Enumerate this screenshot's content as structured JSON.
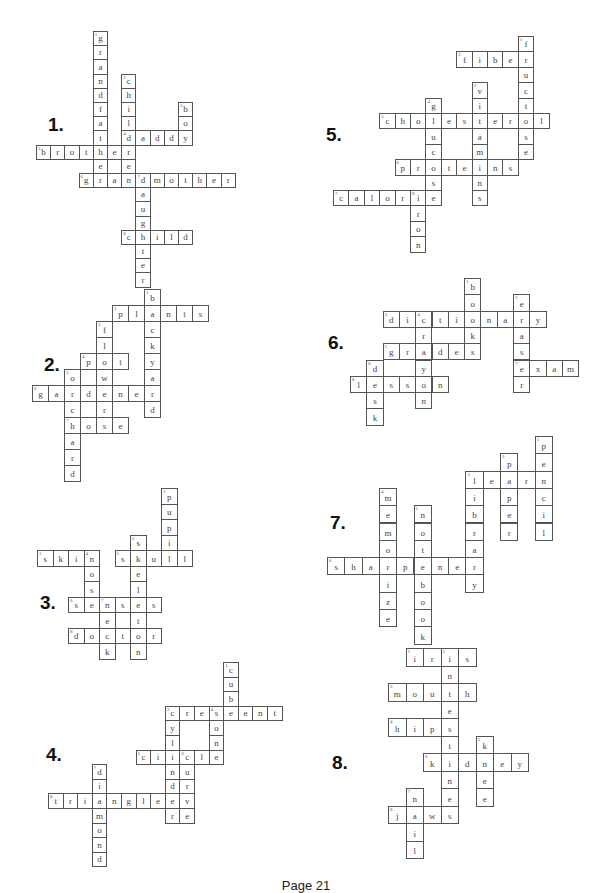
{
  "page": {
    "footer": "Page 21"
  },
  "puzzles": [
    {
      "number": "1.",
      "label_pos": [
        48,
        114
      ],
      "origin": [
        36,
        31
      ],
      "cell": 14.2,
      "words": [
        {
          "n": "1",
          "word": "grandfather",
          "dir": "down",
          "r": 0,
          "c": 4
        },
        {
          "n": "2",
          "word": "children",
          "dir": "down",
          "r": 3,
          "c": 6
        },
        {
          "n": "3",
          "word": "boy",
          "dir": "down",
          "r": 5,
          "c": 10
        },
        {
          "n": "4",
          "word": "daddy",
          "dir": "across",
          "r": 7,
          "c": 6
        },
        {
          "n": "5",
          "word": "brother",
          "dir": "across",
          "r": 8,
          "c": 0
        },
        {
          "n": "6",
          "word": "grandmother",
          "dir": "across",
          "r": 10,
          "c": 3
        },
        {
          "n": "7",
          "word": "daughter",
          "dir": "down",
          "r": 10,
          "c": 7
        },
        {
          "n": "8",
          "word": "child",
          "dir": "across",
          "r": 14,
          "c": 6
        }
      ]
    },
    {
      "number": "2.",
      "label_pos": [
        44,
        354
      ],
      "origin": [
        32,
        289
      ],
      "cell": 16,
      "words": [
        {
          "n": "1",
          "word": "backyard",
          "dir": "down",
          "r": 0,
          "c": 7
        },
        {
          "n": "2",
          "word": "plants",
          "dir": "across",
          "r": 1,
          "c": 5
        },
        {
          "n": "3",
          "word": "flower",
          "dir": "down",
          "r": 2,
          "c": 4
        },
        {
          "n": "4",
          "word": "pot",
          "dir": "across",
          "r": 4,
          "c": 3
        },
        {
          "n": "5",
          "word": "orchard",
          "dir": "down",
          "r": 5,
          "c": 2
        },
        {
          "n": "6",
          "word": "gardener",
          "dir": "across",
          "r": 6,
          "c": 0
        },
        {
          "n": "7",
          "word": "hose",
          "dir": "across",
          "r": 8,
          "c": 2
        }
      ]
    },
    {
      "number": "3.",
      "label_pos": [
        40,
        592
      ],
      "origin": [
        37,
        488
      ],
      "cell": 15.5,
      "words": [
        {
          "n": "1",
          "word": "pupil",
          "dir": "down",
          "r": 0,
          "c": 8
        },
        {
          "n": "2",
          "word": "skeleton",
          "dir": "down",
          "r": 3,
          "c": 6
        },
        {
          "n": "3",
          "word": "skin",
          "dir": "across",
          "r": 4,
          "c": 0
        },
        {
          "n": "4",
          "word": "nose",
          "dir": "down",
          "r": 4,
          "c": 3
        },
        {
          "n": "5",
          "word": "skull",
          "dir": "across",
          "r": 4,
          "c": 5
        },
        {
          "n": "6",
          "word": "senses",
          "dir": "across",
          "r": 7,
          "c": 2
        },
        {
          "n": "7",
          "word": "neck",
          "dir": "down",
          "r": 7,
          "c": 4
        },
        {
          "n": "8",
          "word": "doctor",
          "dir": "across",
          "r": 9,
          "c": 2
        }
      ]
    },
    {
      "number": "4.",
      "label_pos": [
        46,
        744
      ],
      "origin": [
        48,
        662
      ],
      "cell": 14.6,
      "words": [
        {
          "n": "1",
          "word": "cube",
          "dir": "down",
          "r": 0,
          "c": 12
        },
        {
          "n": "2",
          "word": "crescent",
          "dir": "across",
          "r": 3,
          "c": 8
        },
        {
          "n": "3",
          "word": "cylinder",
          "dir": "down",
          "r": 3,
          "c": 8
        },
        {
          "n": "4",
          "word": "cone",
          "dir": "down",
          "r": 3,
          "c": 11
        },
        {
          "n": "5",
          "word": "circle",
          "dir": "across",
          "r": 6,
          "c": 6
        },
        {
          "n": "6",
          "word": "curve",
          "dir": "down",
          "r": 6,
          "c": 9
        },
        {
          "n": "7",
          "word": "diamond",
          "dir": "down",
          "r": 7,
          "c": 3
        },
        {
          "n": "8",
          "word": "triangle",
          "dir": "across",
          "r": 9,
          "c": 0
        }
      ]
    },
    {
      "number": "5.",
      "label_pos": [
        326,
        124
      ],
      "origin": [
        333,
        36
      ],
      "cell": 15.4,
      "words": [
        {
          "n": "1",
          "word": "fructose",
          "dir": "down",
          "r": 0,
          "c": 12
        },
        {
          "n": "2",
          "word": "fiber",
          "dir": "across",
          "r": 1,
          "c": 8
        },
        {
          "n": "3",
          "word": "vitamins",
          "dir": "down",
          "r": 3,
          "c": 9
        },
        {
          "n": "4",
          "word": "glucose",
          "dir": "down",
          "r": 4,
          "c": 6
        },
        {
          "n": "5",
          "word": "cholesterol",
          "dir": "across",
          "r": 5,
          "c": 3
        },
        {
          "n": "6",
          "word": "proteins",
          "dir": "across",
          "r": 8,
          "c": 4
        },
        {
          "n": "7",
          "word": "calorie",
          "dir": "across",
          "r": 10,
          "c": 0
        },
        {
          "n": "8",
          "word": "iron",
          "dir": "down",
          "r": 10,
          "c": 5
        }
      ]
    },
    {
      "number": "6.",
      "label_pos": [
        328,
        332
      ],
      "origin": [
        350,
        278
      ],
      "cell": 16.3,
      "words": [
        {
          "n": "1",
          "word": "books",
          "dir": "down",
          "r": 0,
          "c": 7
        },
        {
          "n": "2",
          "word": "eraser",
          "dir": "down",
          "r": 1,
          "c": 10
        },
        {
          "n": "3",
          "word": "dictionary",
          "dir": "across",
          "r": 2,
          "c": 2
        },
        {
          "n": "4",
          "word": "crayon",
          "dir": "down",
          "r": 2,
          "c": 4
        },
        {
          "n": "5",
          "word": "grades",
          "dir": "across",
          "r": 4,
          "c": 2
        },
        {
          "n": "6",
          "word": "desk",
          "dir": "down",
          "r": 5,
          "c": 1
        },
        {
          "n": "7",
          "word": "exam",
          "dir": "across",
          "r": 5,
          "c": 10
        },
        {
          "n": "8",
          "word": "lesson",
          "dir": "across",
          "r": 6,
          "c": 0
        }
      ]
    },
    {
      "number": "7.",
      "label_pos": [
        330,
        512
      ],
      "origin": [
        327,
        436
      ],
      "cell": 17.3,
      "words": [
        {
          "n": "1",
          "word": "pencil",
          "dir": "down",
          "r": 0,
          "c": 12
        },
        {
          "n": "2",
          "word": "paper",
          "dir": "down",
          "r": 1,
          "c": 10
        },
        {
          "n": "3",
          "word": "library",
          "dir": "down",
          "r": 2,
          "c": 8
        },
        {
          "n": "3",
          "word": "learn",
          "dir": "across",
          "r": 2,
          "c": 8
        },
        {
          "n": "4",
          "word": "memorize",
          "dir": "down",
          "r": 3,
          "c": 3
        },
        {
          "n": "5",
          "word": "notebook",
          "dir": "down",
          "r": 4,
          "c": 5
        },
        {
          "n": "6",
          "word": "sharpener",
          "dir": "across",
          "r": 7,
          "c": 0
        }
      ]
    },
    {
      "number": "8.",
      "label_pos": [
        332,
        752
      ],
      "origin": [
        388,
        648
      ],
      "cell": 17.5,
      "words": [
        {
          "n": "1",
          "word": "iris",
          "dir": "across",
          "r": 0,
          "c": 1
        },
        {
          "n": "2",
          "word": "intestines",
          "dir": "down",
          "r": 0,
          "c": 3
        },
        {
          "n": "3",
          "word": "mouth",
          "dir": "across",
          "r": 2,
          "c": 0
        },
        {
          "n": "4",
          "word": "hips",
          "dir": "across",
          "r": 4,
          "c": 0
        },
        {
          "n": "5",
          "word": "knee",
          "dir": "down",
          "r": 5,
          "c": 5
        },
        {
          "n": "6",
          "word": "kidney",
          "dir": "across",
          "r": 6,
          "c": 2
        },
        {
          "n": "7",
          "word": "nail",
          "dir": "down",
          "r": 8,
          "c": 1
        },
        {
          "n": "8",
          "word": "jaws",
          "dir": "across",
          "r": 9,
          "c": 0
        }
      ]
    }
  ]
}
